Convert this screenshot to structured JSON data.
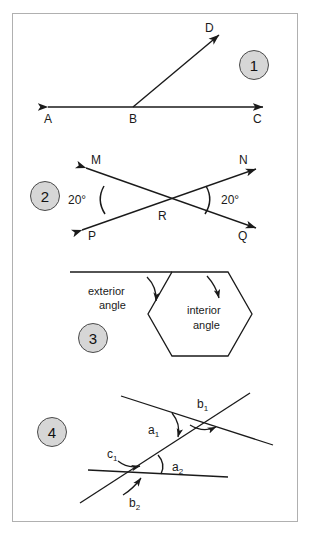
{
  "page": {
    "background": "#ffffff",
    "border_color": "#b0b0b0",
    "ink_color": "#1a1a1a",
    "badge_fill": "#d6d6d6",
    "badge_border": "#4a4a4a"
  },
  "panels": [
    {
      "number": "1",
      "topic": "ray-on-line-angle",
      "labels": {
        "point_a": "A",
        "point_b": "B",
        "point_c": "C",
        "point_d": "D"
      }
    },
    {
      "number": "2",
      "topic": "vertical-angles",
      "labels": {
        "point_m": "M",
        "point_n": "N",
        "point_p": "P",
        "point_q": "Q",
        "point_r": "R",
        "angle_left": "20°",
        "angle_right": "20°"
      }
    },
    {
      "number": "3",
      "topic": "hexagon-interior-exterior-angle",
      "labels": {
        "exterior_line1": "exterior",
        "exterior_line2": "angle",
        "interior_line1": "interior",
        "interior_line2": "angle"
      }
    },
    {
      "number": "4",
      "topic": "transversal-angle-pairs",
      "labels": {
        "b1": "b",
        "b1_sub": "1",
        "a1": "a",
        "a1_sub": "1",
        "c1": "c",
        "c1_sub": "1",
        "a2": "a",
        "a2_sub": "2",
        "b2": "b",
        "b2_sub": "2"
      }
    }
  ]
}
